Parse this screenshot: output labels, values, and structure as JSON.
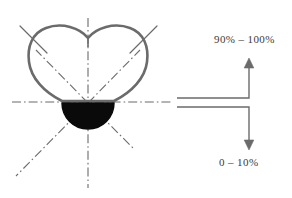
{
  "figure": {
    "title": "",
    "background_color": "#ffffff",
    "line_color": "#6b6b6b",
    "fill_color": "#0a0a0a",
    "text_color": "#3a3a3a"
  },
  "annotations": {
    "upper_label": "90% – 100%",
    "lower_label": "0 – 10%"
  },
  "shape": {
    "name": "heart-cross-section",
    "description": "heart-shaped closed outline with top center notch",
    "fill_region_name": "filled-semicircle",
    "center_point": {
      "x": 88,
      "y": 103
    }
  },
  "axes": {
    "style": "dash-dot center lines",
    "items": [
      {
        "name": "vertical-centerline",
        "orientation": "vertical"
      },
      {
        "name": "horizontal-centerline",
        "orientation": "horizontal"
      },
      {
        "name": "diagonal-upper-left",
        "orientation": "diagonal"
      },
      {
        "name": "diagonal-upper-right",
        "orientation": "diagonal"
      },
      {
        "name": "diagonal-lower-left",
        "orientation": "diagonal"
      },
      {
        "name": "diagonal-lower-right",
        "orientation": "diagonal"
      }
    ]
  },
  "callout": {
    "name": "dimension-bracket",
    "arrow_up_name": "arrow-up",
    "arrow_down_name": "arrow-down",
    "leader_upper_name": "leader-line-upper",
    "leader_lower_name": "leader-line-lower"
  }
}
